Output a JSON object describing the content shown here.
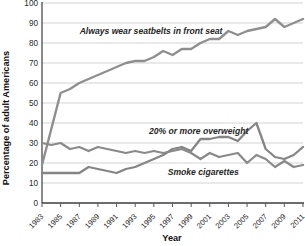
{
  "chart_data": {
    "type": "line",
    "title": "",
    "xlabel": "Year",
    "ylabel": "Percentage of adult Americans",
    "xlim": [
      1983,
      2011
    ],
    "ylim": [
      0,
      100
    ],
    "grid": "horizontal",
    "legend": "inline-annotations",
    "x": [
      1983,
      1984,
      1985,
      1986,
      1987,
      1988,
      1989,
      1990,
      1991,
      1992,
      1993,
      1994,
      1995,
      1996,
      1997,
      1998,
      1999,
      2000,
      2001,
      2002,
      2003,
      2004,
      2005,
      2006,
      2007,
      2008,
      2009,
      2010,
      2011
    ],
    "x_tick_labels": [
      "1983",
      "1985",
      "1987",
      "1989",
      "1991",
      "1993",
      "1995",
      "1997",
      "1999",
      "2001",
      "2003",
      "2005",
      "2007",
      "2009",
      "2011"
    ],
    "y_ticks": [
      0,
      10,
      20,
      30,
      40,
      50,
      60,
      70,
      80,
      90,
      100
    ],
    "series": [
      {
        "name": "Always wear seatbelts in front seat",
        "color": "#8f8f8f",
        "stroke_width": 2.4,
        "values": [
          19,
          37,
          55,
          57,
          60,
          62,
          64,
          66,
          68,
          70,
          71,
          71,
          73,
          76,
          74,
          77,
          77,
          80,
          82,
          82,
          86,
          84,
          86,
          87,
          88,
          92,
          88,
          90,
          92
        ]
      },
      {
        "name": "20% or more overweight",
        "color": "#858585",
        "stroke_width": 2.3,
        "values": [
          15,
          15,
          15,
          15,
          15,
          18,
          17,
          16,
          15,
          17,
          18,
          20,
          22,
          24,
          27,
          28,
          26,
          32,
          32,
          33,
          33,
          31,
          36,
          40,
          27,
          23,
          22,
          24,
          28
        ]
      },
      {
        "name": "Smoke cigarettes",
        "color": "#8a8a8a",
        "stroke_width": 2.3,
        "values": [
          30,
          29,
          30,
          27,
          28,
          26,
          28,
          27,
          26,
          25,
          26,
          25,
          26,
          25,
          26,
          27,
          25,
          22,
          25,
          23,
          24,
          25,
          20,
          24,
          22,
          18,
          21,
          18,
          19
        ]
      }
    ],
    "annotations": [
      {
        "series": 0,
        "x": 1994.7,
        "y": 84.5
      },
      {
        "series": 1,
        "x": 1999.8,
        "y": 34.5
      },
      {
        "series": 2,
        "x": 2000.3,
        "y": 14.0
      }
    ],
    "colors": {
      "grid": "#c8c8c8",
      "axis": "#3c3c3c",
      "tick": "#555555",
      "background": "#ffffff"
    }
  }
}
